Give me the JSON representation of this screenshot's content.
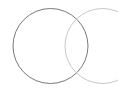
{
  "diagram": {
    "type": "venn",
    "circles": [
      {
        "name": "left",
        "cx": 50.5,
        "cy": 46,
        "r": 37.5,
        "stroke": "#7a7a7a"
      },
      {
        "name": "right",
        "cx": 102.5,
        "cy": 46,
        "r": 37.5,
        "stroke": "#c8c8c8"
      }
    ]
  }
}
